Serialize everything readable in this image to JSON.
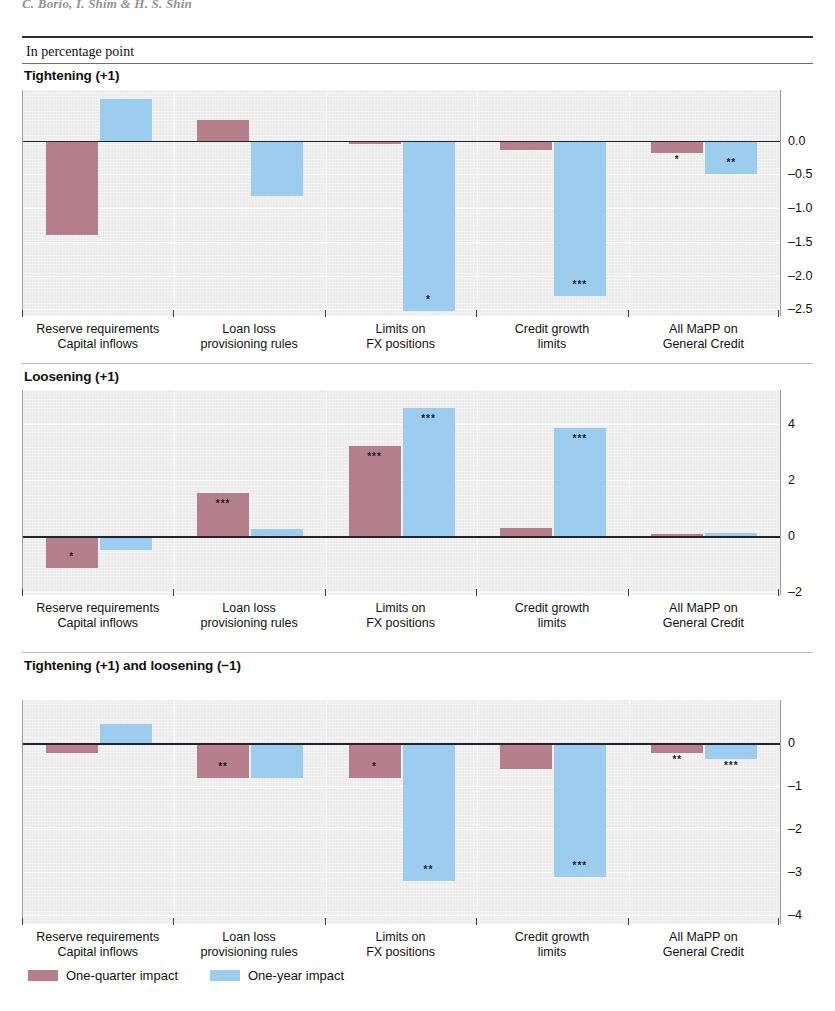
{
  "running_head": "C. Borio, I. Shim & H. S. Shin",
  "units_label": "In percentage point",
  "legend": [
    {
      "label": "One-quarter impact",
      "color": "#b5808b",
      "key": "quarter"
    },
    {
      "label": "One-year impact",
      "color": "#9ccdef",
      "key": "year"
    }
  ],
  "categories": [
    "Reserve requirements\nCapital inflows",
    "Loan loss\nprovisioning rules",
    "Limits on\nFX positions",
    "Credit growth\nlimits",
    "All MaPP on\nGeneral Credit"
  ],
  "category_lines": [
    [
      "Reserve requirements",
      "Capital inflows"
    ],
    [
      "Loan loss",
      "provisioning rules"
    ],
    [
      "Limits on",
      "FX positions"
    ],
    [
      "Credit growth",
      "limits"
    ],
    [
      "All MaPP on",
      "General Credit"
    ]
  ],
  "chart_data": [
    {
      "type": "bar",
      "title": "Tightening (+1)",
      "xlabel": "",
      "ylabel": "In percentage point",
      "ylim": [
        -2.6,
        0.75
      ],
      "yticks": [
        0.0,
        -0.5,
        -1.0,
        -1.5,
        -2.0,
        -2.5
      ],
      "ytick_labels": [
        "0.0",
        "–0.5",
        "–1.0",
        "–1.5",
        "–2.0",
        "–2.5"
      ],
      "grid": true,
      "legend_position": "bottom",
      "categories": [
        "Reserve requirements Capital inflows",
        "Loan loss provisioning rules",
        "Limits on FX positions",
        "Credit growth limits",
        "All MaPP on General Credit"
      ],
      "series": [
        {
          "name": "One-quarter impact",
          "color": "#b5808b",
          "values": [
            -1.4,
            0.3,
            -0.05,
            -0.14,
            -0.19
          ],
          "significance": [
            "",
            "",
            "",
            "",
            "*"
          ]
        },
        {
          "name": "One-year impact",
          "color": "#9ccdef",
          "values": [
            0.62,
            -0.82,
            -2.52,
            -2.3,
            -0.5
          ],
          "significance": [
            "",
            "",
            "*",
            "***",
            "**"
          ]
        }
      ]
    },
    {
      "type": "bar",
      "title": "Loosening (+1)",
      "xlabel": "",
      "ylabel": "In percentage point",
      "ylim": [
        -2.1,
        5.2
      ],
      "yticks": [
        4,
        2,
        0,
        -2
      ],
      "ytick_labels": [
        "4",
        "2",
        "0",
        "–2"
      ],
      "grid": true,
      "legend_position": "bottom",
      "categories": [
        "Reserve requirements Capital inflows",
        "Loan loss provisioning rules",
        "Limits on FX positions",
        "Credit growth limits",
        "All MaPP on General Credit"
      ],
      "series": [
        {
          "name": "One-quarter impact",
          "color": "#b5808b",
          "values": [
            -1.15,
            1.55,
            3.2,
            0.3,
            0.06
          ],
          "significance": [
            "*",
            "***",
            "***",
            "",
            ""
          ]
        },
        {
          "name": "One-year impact",
          "color": "#9ccdef",
          "values": [
            -0.5,
            0.25,
            4.55,
            3.85,
            0.12
          ],
          "significance": [
            "",
            "",
            "***",
            "***",
            ""
          ]
        }
      ]
    },
    {
      "type": "bar",
      "title": "Tightening (+1) and loosening (−1)",
      "xlabel": "",
      "ylabel": "In percentage point",
      "ylim": [
        -4.2,
        1.0
      ],
      "yticks": [
        0,
        -1,
        -2,
        -3,
        -4
      ],
      "ytick_labels": [
        "0",
        "–1",
        "–2",
        "–3",
        "–4"
      ],
      "grid": true,
      "legend_position": "bottom",
      "categories": [
        "Reserve requirements Capital inflows",
        "Loan loss provisioning rules",
        "Limits on FX positions",
        "Credit growth limits",
        "All MaPP on General Credit"
      ],
      "series": [
        {
          "name": "One-quarter impact",
          "color": "#b5808b",
          "values": [
            -0.22,
            -0.8,
            -0.82,
            -0.6,
            -0.22
          ],
          "significance": [
            "",
            "**",
            "*",
            "",
            "**"
          ]
        },
        {
          "name": "One-year impact",
          "color": "#9ccdef",
          "values": [
            0.44,
            -0.8,
            -3.2,
            -3.1,
            -0.38
          ],
          "significance": [
            "",
            "",
            "**",
            "***",
            "***"
          ]
        }
      ]
    }
  ]
}
